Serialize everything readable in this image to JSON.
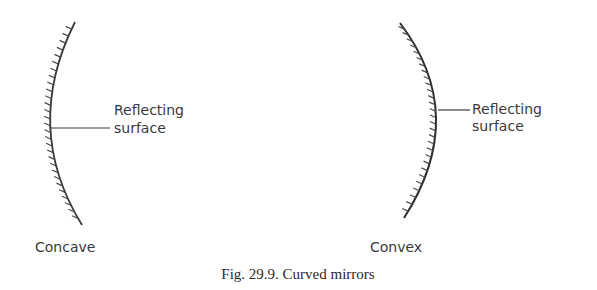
{
  "figure": {
    "caption": "Fig. 29.9. Curved mirrors",
    "ink_color": "#3a3a3a",
    "mirrors": [
      {
        "name": "Concave",
        "label": "Concave",
        "pointer_label_line1": "Reflecting",
        "pointer_label_line2": "surface"
      },
      {
        "name": "Convex",
        "label": "Convex",
        "pointer_label_line1": "Reflecting",
        "pointer_label_line2": "surface"
      }
    ]
  }
}
